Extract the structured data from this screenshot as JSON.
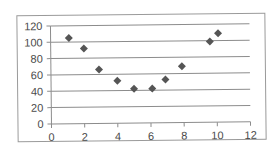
{
  "chart_data": {
    "type": "scatter",
    "title": "",
    "xlabel": "",
    "ylabel": "",
    "xlim": [
      0,
      12
    ],
    "ylim": [
      0,
      120
    ],
    "x_ticks": [
      0,
      2,
      4,
      6,
      8,
      10,
      12
    ],
    "y_ticks": [
      0,
      20,
      40,
      60,
      80,
      100,
      120
    ],
    "grid": {
      "horizontal": true,
      "vertical": false
    },
    "legend": null,
    "marker": "diamond",
    "marker_color": "#555555",
    "gridline_color": "#8c8c8c",
    "series": [
      {
        "name": "Series1",
        "points": [
          {
            "x": 1.1,
            "y": 105
          },
          {
            "x": 2.0,
            "y": 92
          },
          {
            "x": 2.9,
            "y": 66
          },
          {
            "x": 4.0,
            "y": 52
          },
          {
            "x": 5.0,
            "y": 42
          },
          {
            "x": 6.1,
            "y": 42
          },
          {
            "x": 6.9,
            "y": 53
          },
          {
            "x": 7.9,
            "y": 69
          },
          {
            "x": 9.6,
            "y": 99
          },
          {
            "x": 10.1,
            "y": 109
          }
        ]
      }
    ]
  }
}
